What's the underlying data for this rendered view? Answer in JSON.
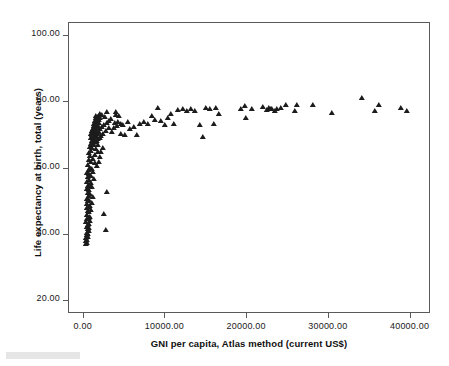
{
  "chart_data": {
    "type": "scatter",
    "title": "",
    "xlabel": "GNI per capita, Atlas method (current US$)",
    "ylabel": "Life expectancy at birth, total (years)",
    "xlim": [
      -1800,
      42500
    ],
    "ylim": [
      16.0,
      104.0
    ],
    "grid": false,
    "legend": null,
    "marker": "triangle-filled",
    "marker_color": "#1c1c1c",
    "xticks": [
      0,
      10000,
      20000,
      30000,
      40000
    ],
    "xtick_labels": [
      "0.00",
      "10000.00",
      "20000.00",
      "30000.00",
      "40000.00"
    ],
    "yticks": [
      20,
      40,
      60,
      80,
      100
    ],
    "ytick_labels": [
      "20.00",
      "40.00",
      "60.00",
      "80.00",
      "100.00"
    ],
    "series": [
      {
        "name": "Countries",
        "points": [
          [
            330,
            37.2
          ],
          [
            350,
            37.6
          ],
          [
            290,
            38.0
          ],
          [
            420,
            38.4
          ],
          [
            310,
            38.9
          ],
          [
            480,
            39.3
          ],
          [
            360,
            39.8
          ],
          [
            540,
            40.2
          ],
          [
            400,
            40.6
          ],
          [
            620,
            41.0
          ],
          [
            2700,
            41.3
          ],
          [
            470,
            41.6
          ],
          [
            700,
            42.0
          ],
          [
            390,
            42.4
          ],
          [
            560,
            42.8
          ],
          [
            640,
            43.3
          ],
          [
            330,
            43.7
          ],
          [
            760,
            44.1
          ],
          [
            450,
            44.6
          ],
          [
            590,
            45.0
          ],
          [
            820,
            45.4
          ],
          [
            380,
            45.8
          ],
          [
            2450,
            46.3
          ],
          [
            690,
            46.7
          ],
          [
            510,
            47.1
          ],
          [
            880,
            47.5
          ],
          [
            430,
            48.0
          ],
          [
            620,
            48.4
          ],
          [
            740,
            48.8
          ],
          [
            360,
            49.2
          ],
          [
            960,
            49.6
          ],
          [
            540,
            50.1
          ],
          [
            680,
            50.5
          ],
          [
            430,
            50.9
          ],
          [
            1180,
            51.3
          ],
          [
            600,
            51.7
          ],
          [
            820,
            52.2
          ],
          [
            470,
            52.6
          ],
          [
            2900,
            53.0
          ],
          [
            700,
            53.4
          ],
          [
            380,
            53.8
          ],
          [
            1050,
            54.3
          ],
          [
            560,
            54.7
          ],
          [
            760,
            55.1
          ],
          [
            900,
            55.6
          ],
          [
            450,
            56.0
          ],
          [
            640,
            56.4
          ],
          [
            1300,
            56.9
          ],
          [
            520,
            57.3
          ],
          [
            880,
            57.7
          ],
          [
            700,
            58.2
          ],
          [
            410,
            58.6
          ],
          [
            1150,
            59.0
          ],
          [
            620,
            59.5
          ],
          [
            980,
            59.9
          ],
          [
            760,
            60.3
          ],
          [
            1650,
            60.8
          ],
          [
            540,
            61.2
          ],
          [
            1420,
            61.6
          ],
          [
            860,
            62.0
          ],
          [
            1820,
            62.1
          ],
          [
            680,
            62.5
          ],
          [
            1100,
            62.9
          ],
          [
            1950,
            63.4
          ],
          [
            790,
            63.8
          ],
          [
            1380,
            64.2
          ],
          [
            620,
            64.6
          ],
          [
            1720,
            65.0
          ],
          [
            940,
            65.4
          ],
          [
            2100,
            65.1
          ],
          [
            1520,
            65.8
          ],
          [
            1050,
            66.2
          ],
          [
            760,
            66.6
          ],
          [
            2350,
            66.3
          ],
          [
            1290,
            67.0
          ],
          [
            880,
            67.4
          ],
          [
            1700,
            67.1
          ],
          [
            1160,
            67.8
          ],
          [
            980,
            68.2
          ],
          [
            1450,
            68.0
          ],
          [
            1310,
            68.5
          ],
          [
            1090,
            68.7
          ],
          [
            1600,
            68.3
          ],
          [
            1230,
            69.0
          ],
          [
            860,
            69.2
          ],
          [
            1780,
            68.9
          ],
          [
            1400,
            69.4
          ],
          [
            1120,
            69.6
          ],
          [
            1950,
            69.1
          ],
          [
            1510,
            69.8
          ],
          [
            1020,
            70.0
          ],
          [
            1680,
            69.5
          ],
          [
            1290,
            70.2
          ],
          [
            940,
            70.4
          ],
          [
            2150,
            69.7
          ],
          [
            1430,
            70.6
          ],
          [
            1180,
            70.8
          ],
          [
            1760,
            70.3
          ],
          [
            1330,
            71.0
          ],
          [
            1050,
            71.2
          ],
          [
            2400,
            70.5
          ],
          [
            1560,
            71.4
          ],
          [
            1240,
            71.6
          ],
          [
            1870,
            71.1
          ],
          [
            1420,
            71.8
          ],
          [
            1130,
            72.0
          ],
          [
            2700,
            71.3
          ],
          [
            1640,
            72.2
          ],
          [
            1350,
            72.4
          ],
          [
            2050,
            71.9
          ],
          [
            1490,
            72.6
          ],
          [
            1210,
            72.8
          ],
          [
            3150,
            72.1
          ],
          [
            1720,
            73.0
          ],
          [
            1440,
            73.2
          ],
          [
            2280,
            72.5
          ],
          [
            1580,
            73.4
          ],
          [
            1290,
            73.6
          ],
          [
            3650,
            72.3
          ],
          [
            1830,
            73.8
          ],
          [
            1530,
            74.0
          ],
          [
            2500,
            73.1
          ],
          [
            1670,
            74.2
          ],
          [
            1380,
            74.4
          ],
          [
            4100,
            72.8
          ],
          [
            1930,
            74.6
          ],
          [
            1610,
            74.8
          ],
          [
            2820,
            73.7
          ],
          [
            1750,
            75.0
          ],
          [
            1470,
            75.2
          ],
          [
            4550,
            73.4
          ],
          [
            2040,
            75.4
          ],
          [
            1700,
            75.6
          ],
          [
            3050,
            74.3
          ],
          [
            1860,
            75.8
          ],
          [
            1560,
            76.0
          ],
          [
            2250,
            76.2
          ],
          [
            3400,
            74.9
          ],
          [
            1980,
            76.4
          ],
          [
            2600,
            75.5
          ],
          [
            4000,
            77.0
          ],
          [
            3800,
            73.9
          ],
          [
            4300,
            75.8
          ],
          [
            3900,
            76.3
          ],
          [
            2900,
            77.2
          ],
          [
            4600,
            70.4
          ],
          [
            3500,
            70.9
          ],
          [
            4150,
            74.1
          ],
          [
            4800,
            73.3
          ],
          [
            5100,
            70.2
          ],
          [
            5400,
            74.0
          ],
          [
            5700,
            71.9
          ],
          [
            6100,
            72.5
          ],
          [
            6500,
            70.1
          ],
          [
            6900,
            73.4
          ],
          [
            7400,
            74.0
          ],
          [
            7900,
            73.5
          ],
          [
            8300,
            76.0
          ],
          [
            8700,
            74.6
          ],
          [
            9100,
            78.3
          ],
          [
            9500,
            74.3
          ],
          [
            9900,
            73.1
          ],
          [
            10300,
            75.2
          ],
          [
            10700,
            76.5
          ],
          [
            11100,
            73.4
          ],
          [
            11600,
            77.6
          ],
          [
            12100,
            77.9
          ],
          [
            12600,
            77.4
          ],
          [
            13100,
            78.0
          ],
          [
            13600,
            77.5
          ],
          [
            14200,
            73.3
          ],
          [
            14600,
            69.6
          ],
          [
            15000,
            78.3
          ],
          [
            15400,
            78.0
          ],
          [
            15900,
            73.6
          ],
          [
            16200,
            78.2
          ],
          [
            16500,
            76.6
          ],
          [
            19200,
            78.1
          ],
          [
            19700,
            79.0
          ],
          [
            19900,
            75.2
          ],
          [
            20600,
            77.9
          ],
          [
            21900,
            78.5
          ],
          [
            22400,
            77.8
          ],
          [
            22700,
            78.2
          ],
          [
            22900,
            77.9
          ],
          [
            23100,
            78.1
          ],
          [
            23400,
            77.3
          ],
          [
            23700,
            78.0
          ],
          [
            24100,
            78.3
          ],
          [
            24800,
            79.1
          ],
          [
            25900,
            77.5
          ],
          [
            26100,
            79.3
          ],
          [
            28100,
            79.2
          ],
          [
            30400,
            76.9
          ],
          [
            34000,
            81.2
          ],
          [
            35700,
            77.4
          ],
          [
            36100,
            79.3
          ],
          [
            38800,
            78.3
          ],
          [
            39600,
            77.5
          ]
        ]
      }
    ]
  },
  "axes": {
    "x_title": "GNI per capita, Atlas method (current US$)",
    "y_title": "Life expectancy at birth, total (years)"
  }
}
